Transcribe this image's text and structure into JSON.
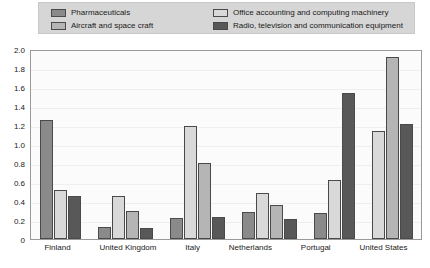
{
  "legend": {
    "entries": [
      {
        "label": "Pharmaceuticals",
        "color": "#8a8a8a",
        "swatch_name": "legend-swatch-pharmaceuticals"
      },
      {
        "label": "Office accounting and computing machinery",
        "color": "#d9d9d9",
        "swatch_name": "legend-swatch-office-machinery"
      },
      {
        "label": "Aircraft and space craft",
        "color": "#b5b5b5",
        "swatch_name": "legend-swatch-aircraft"
      },
      {
        "label": "Radio, television and communication equipment",
        "color": "#585858",
        "swatch_name": "legend-swatch-radio-tv"
      }
    ]
  },
  "chart_data": {
    "type": "bar",
    "title": "",
    "subtitle": "",
    "xlabel": "",
    "ylabel": "",
    "ylim": [
      0,
      2.0
    ],
    "ytick_step": 0.2,
    "yticks": [
      "2.0",
      "1.8",
      "1.6",
      "1.4",
      "1.2",
      "1.0",
      "0.8",
      "0.6",
      "0.4",
      "0.2",
      "0"
    ],
    "grid": true,
    "legend_position": "top",
    "categories": [
      "Finland",
      "United Kingdom",
      "Italy",
      "Netherlands",
      "Portugal",
      "United States"
    ],
    "series": [
      {
        "name": "Pharmaceuticals",
        "color": "#8a8a8a",
        "values": [
          1.25,
          0.13,
          0.22,
          0.28,
          0.27,
          null
        ]
      },
      {
        "name": "Office accounting and computing machinery",
        "color": "#d9d9d9",
        "values": [
          0.52,
          0.45,
          1.19,
          0.48,
          0.62,
          1.14
        ]
      },
      {
        "name": "Aircraft and space craft",
        "color": "#b5b5b5",
        "values": [
          null,
          0.29,
          0.8,
          0.36,
          null,
          1.92
        ]
      },
      {
        "name": "Radio, television and communication equipment",
        "color": "#585858",
        "values": [
          0.45,
          0.12,
          0.23,
          0.21,
          1.54,
          1.21
        ]
      }
    ]
  }
}
